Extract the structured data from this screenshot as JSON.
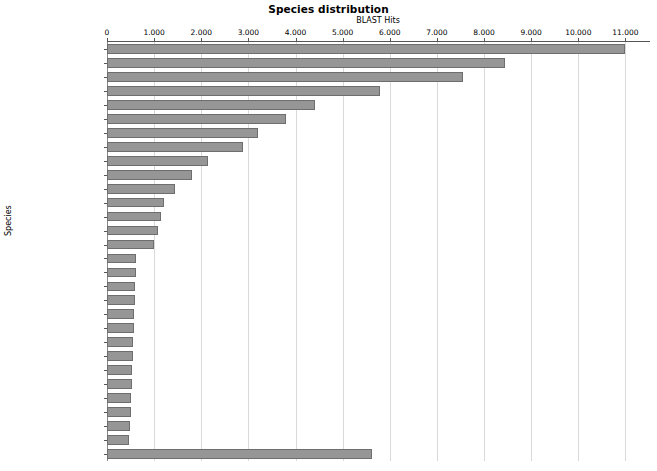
{
  "chart_data": {
    "type": "bar",
    "orientation": "horizontal",
    "title": "Species distribution",
    "xlabel": "BLAST Hits",
    "ylabel": "Species",
    "xlim": [
      0,
      11500
    ],
    "xticks": [
      0,
      1000,
      2000,
      3000,
      4000,
      5000,
      6000,
      7000,
      8000,
      9000,
      10000,
      11000
    ],
    "xtick_labels": [
      "0",
      "1.000",
      "2.000",
      "3.000",
      "4.000",
      "5.000",
      "6.000",
      "7.000",
      "8.000",
      "9.000",
      "10.000",
      "11.000"
    ],
    "grid": true,
    "legend": false,
    "bar_color": "#969696",
    "bar_edge_color": "#6e6e6e",
    "categories": [
      "Vitis vinifera",
      "Prunus persica",
      "Theobroma cacao",
      "Populus trichocarpa",
      "Citrus clementina",
      "Ricinus communis",
      "Fragaria vesca",
      "Glycine max",
      "Cucumis sativus",
      "Medicago truncatula",
      "Cicer arietinum",
      "Oryza sativa",
      "Solanum lycopersicum",
      "Arabidopsis thaliana",
      "Zea mays",
      "Amborella trichopoda",
      "Eutrema salsugineum",
      "Aegilops tauschii",
      "Capsella rubella",
      "Physcomitrella patens",
      "Sorghum bicolor",
      "Arabidopsis lyrata",
      "Hordeum vulgare",
      "Genlisea aurea",
      "Lotus japonicus",
      "Selaginella moellendorffii",
      "Triticum urartu",
      "Setaria italica",
      "Brachypodium distachyon",
      "others"
    ],
    "values": [
      11000,
      8450,
      7550,
      5800,
      4420,
      3800,
      3200,
      2880,
      2150,
      1800,
      1450,
      1220,
      1150,
      1090,
      1000,
      620,
      610,
      600,
      590,
      580,
      570,
      560,
      550,
      540,
      520,
      510,
      500,
      490,
      470,
      5620
    ]
  }
}
